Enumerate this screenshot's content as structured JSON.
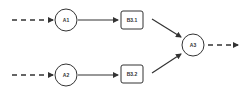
{
  "diagram": {
    "colors": {
      "stroke": "#333333",
      "background": "#ffffff",
      "text": "#333333"
    },
    "nodes": [
      {
        "id": "A1",
        "label": "A1",
        "shape": "circle"
      },
      {
        "id": "A2",
        "label": "A2",
        "shape": "circle"
      },
      {
        "id": "B3.1",
        "label": "B3.1",
        "shape": "rounded-rect"
      },
      {
        "id": "B3.2",
        "label": "B3.2",
        "shape": "rounded-rect"
      },
      {
        "id": "A3",
        "label": "A3",
        "shape": "circle"
      }
    ],
    "edges": [
      {
        "from": "input",
        "to": "A1",
        "style": "dashed"
      },
      {
        "from": "input",
        "to": "A2",
        "style": "dashed"
      },
      {
        "from": "A1",
        "to": "B3.1",
        "style": "solid"
      },
      {
        "from": "A2",
        "to": "B3.2",
        "style": "solid"
      },
      {
        "from": "B3.1",
        "to": "A3",
        "style": "solid"
      },
      {
        "from": "B3.2",
        "to": "A3",
        "style": "solid"
      },
      {
        "from": "A3",
        "to": "output",
        "style": "dashed"
      }
    ]
  }
}
